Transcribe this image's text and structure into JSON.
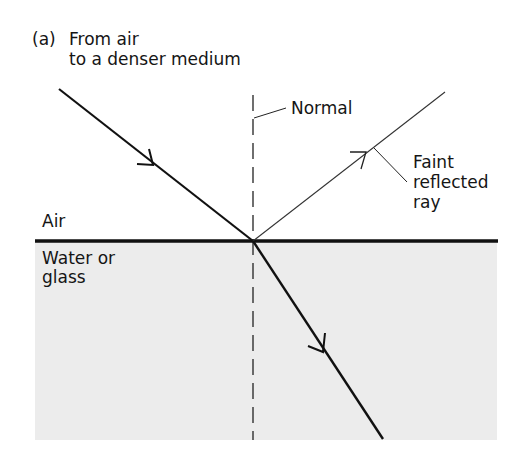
{
  "title": {
    "panel": "(a)",
    "line1": "From air",
    "line2": "to a denser medium"
  },
  "labels": {
    "normal": "Normal",
    "reflected_line1": "Faint",
    "reflected_line2": "reflected",
    "reflected_line3": "ray",
    "air": "Air",
    "medium_line1": "Water or",
    "medium_line2": "glass"
  },
  "colors": {
    "medium_fill": "#ececec",
    "line": "#111111"
  }
}
